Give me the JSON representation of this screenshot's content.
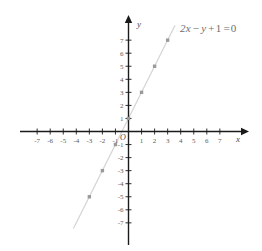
{
  "chart_data": {
    "type": "line",
    "title": "",
    "annotations": [
      {
        "name": "equation",
        "text": "2x − y + 1 = 0",
        "x": 3.6,
        "y": 8.2
      }
    ],
    "xlabel": "x",
    "ylabel": "y",
    "xlim": [
      -8,
      8
    ],
    "ylim": [
      -8,
      8
    ],
    "grid": false,
    "legend": "none",
    "xticks": [
      -7,
      -6,
      -5,
      -4,
      -3,
      -2,
      -1,
      1,
      2,
      3,
      4,
      5,
      6,
      7
    ],
    "yticks": [
      -7,
      -6,
      -5,
      -4,
      -3,
      -2,
      -1,
      1,
      2,
      3,
      4,
      5,
      6,
      7
    ],
    "xtick_labels": [
      "-7",
      "-6",
      "-5",
      "-4",
      "-3",
      "-2",
      "-1",
      "1",
      "2",
      "3",
      "4",
      "5",
      "6",
      "7"
    ],
    "ytick_labels": [
      "-7",
      "-6",
      "-5",
      "-4",
      "-3",
      "-2",
      "-1",
      "1",
      "2",
      "3",
      "4",
      "5",
      "6",
      "7"
    ],
    "origin_label": "O",
    "series": [
      {
        "name": "2x - y + 1 = 0",
        "equation": "y = 2x + 1",
        "slope": 2,
        "intercept": 1,
        "line_from": {
          "x": -4.2,
          "y": -7.4
        },
        "line_to": {
          "x": 3.55,
          "y": 8.1
        },
        "color": "#d6d6d6",
        "marker_color": "#9a9a9a",
        "points": [
          {
            "x": -3,
            "y": -5
          },
          {
            "x": -2,
            "y": -3
          },
          {
            "x": -1,
            "y": -1
          },
          {
            "x": 0,
            "y": 1
          },
          {
            "x": 1,
            "y": 3
          },
          {
            "x": 2,
            "y": 5
          },
          {
            "x": 3,
            "y": 7
          }
        ]
      }
    ]
  },
  "axes": {
    "x_axis_name": "x",
    "y_axis_name": "y",
    "axis_color": "#1a1a1a"
  },
  "equation": {
    "full": "2x − y + 1 = 0",
    "coef_x": "2",
    "var_x": "x",
    "minus": "−",
    "var_y": "y",
    "plus": "+",
    "constant": "1",
    "equals": "=",
    "zero": "0"
  }
}
